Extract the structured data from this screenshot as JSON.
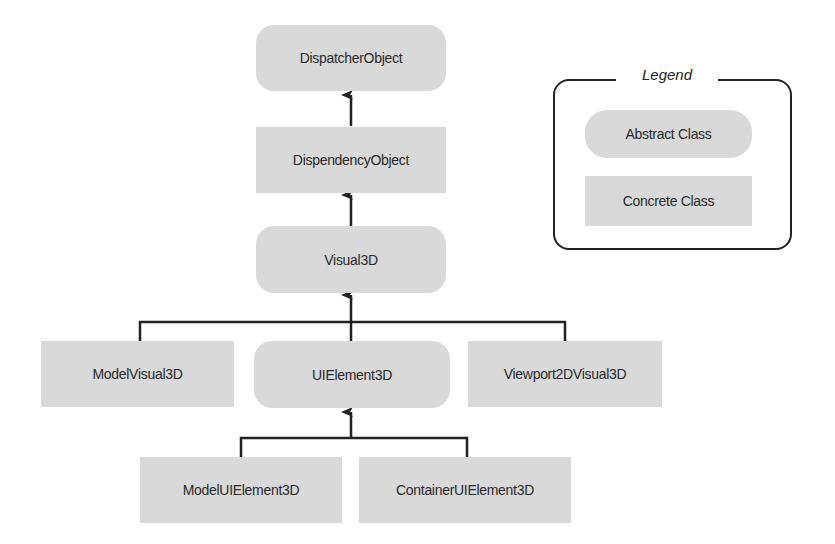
{
  "diagram": {
    "nodes": {
      "dispatcher_object": {
        "label": "DispatcherObject",
        "kind": "abstract"
      },
      "dependency_object": {
        "label": "DispendencyObject",
        "kind": "concrete"
      },
      "visual3d": {
        "label": "Visual3D",
        "kind": "abstract"
      },
      "model_visual3d": {
        "label": "ModelVisual3D",
        "kind": "concrete"
      },
      "ui_element3d": {
        "label": "UIElement3D",
        "kind": "abstract"
      },
      "viewport2d_visual3d": {
        "label": "Viewport2DVisual3D",
        "kind": "concrete"
      },
      "model_ui_element3d": {
        "label": "ModelUIElement3D",
        "kind": "concrete"
      },
      "container_ui_element3d": {
        "label": "ContainerUIElement3D",
        "kind": "concrete"
      }
    },
    "edges": [
      {
        "from": "DispendencyObject",
        "to": "DispatcherObject"
      },
      {
        "from": "Visual3D",
        "to": "DispendencyObject"
      },
      {
        "from": "ModelVisual3D",
        "to": "Visual3D"
      },
      {
        "from": "UIElement3D",
        "to": "Visual3D"
      },
      {
        "from": "Viewport2DVisual3D",
        "to": "Visual3D"
      },
      {
        "from": "ModelUIElement3D",
        "to": "UIElement3D"
      },
      {
        "from": "ContainerUIElement3D",
        "to": "UIElement3D"
      }
    ]
  },
  "legend": {
    "title": "Legend",
    "abstract_label": "Abstract Class",
    "concrete_label": "Concrete Class"
  },
  "colors": {
    "node_fill": "#d9d9d9",
    "line": "#222222",
    "background": "#ffffff"
  }
}
